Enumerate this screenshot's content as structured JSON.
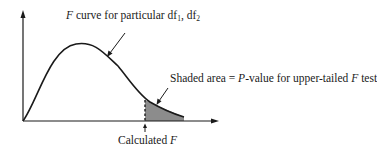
{
  "diagram": {
    "curve_label": {
      "prefix_italic": "F",
      "text": " curve for particular df",
      "sub1": "1",
      "sep": ", df",
      "sub2": "2"
    },
    "shaded_label": {
      "part1": "Shaded area = ",
      "p_italic": "P",
      "part2": "-value for upper-tailed ",
      "f_italic": "F",
      "part3": " test"
    },
    "x_marker_label": {
      "text": "Calculated ",
      "f_italic": "F"
    },
    "colors": {
      "line": "#1a1a1a",
      "shade": "#8c8c8c",
      "background": "#ffffff"
    }
  }
}
